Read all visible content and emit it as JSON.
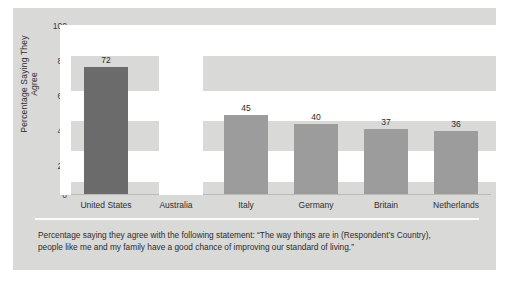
{
  "chart_data": {
    "type": "bar",
    "title": "",
    "xlabel": "",
    "ylabel": "Percentage Saying They Agree",
    "ylim": [
      0,
      100
    ],
    "yticks": [
      "0",
      "20",
      "40",
      "60",
      "80",
      "100"
    ],
    "grid": false,
    "legend": "none",
    "categories": [
      "United States",
      "Australia",
      "Italy",
      "Germany",
      "Britain",
      "Netherlands"
    ],
    "values": [
      72,
      61,
      45,
      40,
      37,
      36
    ],
    "value_labels": [
      "72",
      "61",
      "45",
      "40",
      "37",
      "36"
    ],
    "highlighted_category": "United States",
    "colors": {
      "bar": "#9c9c9c",
      "bar_highlight": "#6b6b6b",
      "panel": "#d9d9d7",
      "text": "#2c2c2c"
    }
  },
  "caption": {
    "line1": "Percentage saying they agree with the following statement: “The way things are in (Respondent’s Country),",
    "line2": "people like me and my family have a good chance of improving our standard of living.”"
  }
}
